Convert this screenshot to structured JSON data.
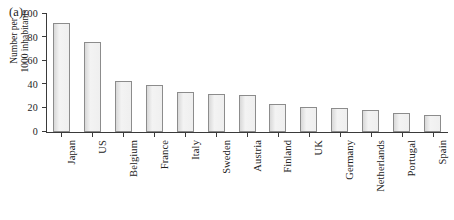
{
  "figure": {
    "panel_label": "(a)",
    "background_color": "#ffffff",
    "bar_fill_color": "#ececec",
    "bar_edge_color": "#8c8c8c",
    "axis_color": "#3a3a3a"
  },
  "chart_data": {
    "type": "bar",
    "title": "",
    "subtitle": "",
    "panel": "(a)",
    "xlabel": "",
    "ylabel": "Number per 1000 inhabitants",
    "ylabel_lines": [
      "Number per",
      "1000 inhabitants"
    ],
    "categories": [
      "Japan",
      "US",
      "Belgium",
      "France",
      "Italy",
      "Sweden",
      "Austria",
      "Finland",
      "UK",
      "Germany",
      "Netherlands",
      "Portugal",
      "Spain"
    ],
    "values": [
      92,
      76,
      43,
      40,
      34,
      32,
      31,
      24,
      21,
      20,
      19,
      16,
      14
    ],
    "ylim": [
      0,
      100
    ],
    "yticks": [
      0,
      20,
      40,
      60,
      80,
      100
    ],
    "ytick_labels": [
      "0",
      "20",
      "40",
      "60",
      "80",
      "100"
    ],
    "grid": false,
    "legend": null,
    "legend_position": "none",
    "annotations": []
  }
}
